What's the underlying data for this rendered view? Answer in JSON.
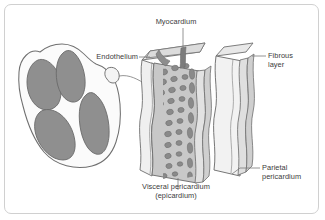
{
  "figure": {
    "kind": "anatomical-diagram",
    "background_color": "#ffffff",
    "frame_color": "#d0d0d0",
    "label_color": "#3b3b3b"
  },
  "labels": {
    "myocardium": "Myocardium",
    "endothelium": "Endothelium",
    "fibrous_layer_line1": "Fibrous",
    "fibrous_layer_line2": "layer",
    "parietal_line1": "Parietal",
    "parietal_line2": "pericardium",
    "visceral_line1": "Visceral pericardium",
    "visceral_line2": "(epicardium)"
  },
  "palette": {
    "outline": "#6f6f6f",
    "heart_wall": "#fbfbfb",
    "chamber_fill": "#8f8f8f",
    "chamber_stroke": "#6a6a6a",
    "layer_pale": "#efefef",
    "layer_light": "#e2e2e2",
    "layer_mid": "#c8c8c8",
    "layer_dark": "#a8a8a8",
    "cell_fill": "#8a8a8a",
    "cell_stroke": "#6d6d6d",
    "band_dark": "#7c7c7c",
    "leader": "#7a7a7a"
  },
  "heart": {
    "name": "heart-cross-section",
    "chambers": 4,
    "description": "Frontal section of the heart showing four gray chambers within a white muscular wall"
  },
  "tissue_block": {
    "name": "heart-wall-tissue-block",
    "description": "Three-dimensional cut-away block of heart wall layers drawn with wavy vertical bands",
    "layers": [
      "Endothelium",
      "Myocardium",
      "Visceral pericardium (epicardium)",
      "Parietal pericardium",
      "Fibrous layer"
    ],
    "cell_count": 46
  }
}
